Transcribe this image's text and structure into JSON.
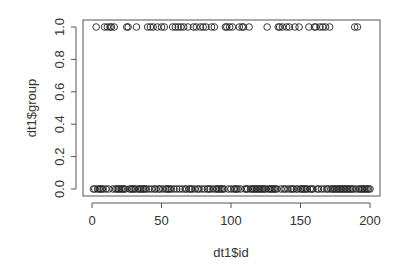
{
  "chart_data": {
    "type": "scatter",
    "title": "",
    "xlabel": "dt1$id",
    "ylabel": "dt1$group",
    "xlim": [
      0,
      200
    ],
    "ylim": [
      0,
      1
    ],
    "x_ticks": [
      "0",
      "50",
      "100",
      "150",
      "200"
    ],
    "y_ticks": [
      "0.0",
      "0.2",
      "0.4",
      "0.6",
      "0.8",
      "1.0"
    ],
    "grid": false,
    "legend": null,
    "series": [
      {
        "name": "group = 1",
        "y": 1,
        "x": [
          3,
          9,
          11,
          13,
          14,
          16,
          25,
          26,
          32,
          40,
          42,
          44,
          47,
          50,
          52,
          58,
          60,
          62,
          64,
          66,
          69,
          73,
          75,
          78,
          80,
          82,
          86,
          88,
          96,
          97,
          99,
          101,
          106,
          108,
          109,
          113,
          126,
          134,
          135,
          137,
          140,
          142,
          146,
          149,
          156,
          160,
          161,
          164,
          166,
          168,
          171,
          189,
          191
        ]
      },
      {
        "name": "group = 0",
        "y": 0,
        "x": "all remaining ids in 1..200"
      }
    ]
  }
}
